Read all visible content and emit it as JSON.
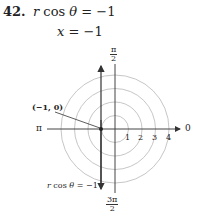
{
  "problem": {
    "number": "42.",
    "equation_line1_lhs": "r",
    "equation_line1_mid": " cos ",
    "equation_line1_theta": "θ",
    "equation_line1_rhs": " = −1",
    "equation_line2_lhs": "x",
    "equation_line2_rhs": " = −1"
  },
  "graph": {
    "angle_top_num": "π",
    "angle_top_den": "2",
    "angle_bottom_num": "3π",
    "angle_bottom_den": "2",
    "angle_left": "π",
    "angle_right": "0",
    "point_label": "(−1, 0)",
    "ring_labels": [
      "1",
      "2",
      "3",
      "4"
    ],
    "line_label_r": "r",
    "line_label_rest": " cos ",
    "line_label_theta": "θ",
    "line_label_rhs": " = −1",
    "colors": {
      "axis": "#444444",
      "ring": "#b8b8b8",
      "line": "#333333"
    }
  }
}
